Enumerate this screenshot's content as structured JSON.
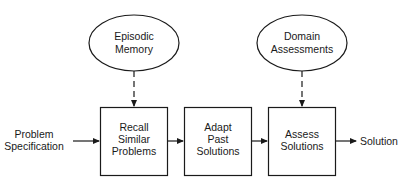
{
  "diagram": {
    "colors": {
      "stroke": "#1a1a1a",
      "background": "#ffffff"
    },
    "ellipses": [
      {
        "id": "episodic-memory",
        "lines": [
          "Episodic",
          "Memory"
        ]
      },
      {
        "id": "domain-assessments",
        "lines": [
          "Domain",
          "Assessments"
        ]
      }
    ],
    "boxes": [
      {
        "id": "recall-similar-problems",
        "lines": [
          "Recall",
          "Similar",
          "Problems"
        ]
      },
      {
        "id": "adapt-past-solutions",
        "lines": [
          "Adapt",
          "Past",
          "Solutions"
        ]
      },
      {
        "id": "assess-solutions",
        "lines": [
          "Assess",
          "Solutions"
        ]
      }
    ],
    "input": {
      "lines": [
        "Problem",
        "Specification"
      ]
    },
    "output": {
      "label": "Solution"
    },
    "edges": [
      {
        "from": "Episodic Memory",
        "to": "Recall Similar Problems",
        "style": "dashed"
      },
      {
        "from": "Domain Assessments",
        "to": "Assess Solutions",
        "style": "dashed"
      },
      {
        "from": "Problem Specification",
        "to": "Recall Similar Problems",
        "style": "solid"
      },
      {
        "from": "Recall Similar Problems",
        "to": "Adapt Past Solutions",
        "style": "solid"
      },
      {
        "from": "Adapt Past Solutions",
        "to": "Assess Solutions",
        "style": "solid"
      },
      {
        "from": "Assess Solutions",
        "to": "Solution",
        "style": "solid"
      }
    ]
  }
}
